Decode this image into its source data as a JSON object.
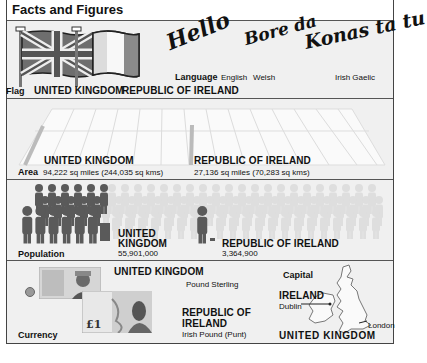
{
  "title": "Facts and Figures",
  "flag": {
    "label": "Flag",
    "uk": "UNITED KINGDOM",
    "ie": "REPUBLIC OF IRELAND"
  },
  "language": {
    "label": "Language",
    "greetings": [
      {
        "word": "Hello",
        "language": "English"
      },
      {
        "word": "Bore da",
        "language": "Welsh"
      },
      {
        "word": "Konas ta tu",
        "language": "Irish Gaelic"
      }
    ]
  },
  "area": {
    "label": "Area",
    "uk": {
      "name": "UNITED KINGDOM",
      "value": "94,222 sq miles (244,035 sq kms)"
    },
    "ie": {
      "name": "REPUBLIC OF IRELAND",
      "value": "27,136 sq miles (70,283 sq kms)"
    }
  },
  "population": {
    "label": "Population",
    "uk": {
      "name_line1": "UNITED",
      "name_line2": "KINGDOM",
      "value": "55,901,000"
    },
    "ie": {
      "name": "REPUBLIC OF IRELAND",
      "value": "3,364,900"
    }
  },
  "currency": {
    "label": "Currency",
    "uk": {
      "name": "UNITED KINGDOM",
      "value": "Pound Sterling",
      "note": "£1"
    },
    "ie": {
      "name_line1": "REPUBLIC OF",
      "name_line2": "IRELAND",
      "value": "Irish Pound (Punt)"
    }
  },
  "capital": {
    "label": "Capital",
    "ie": {
      "name": "IRELAND",
      "city": "Dublin"
    },
    "uk": {
      "name": "UNITED KINGDOM",
      "city": "London"
    }
  },
  "colors": {
    "frame": "#444444",
    "panel": "#f0f0f0",
    "figure_dark": "#5a5a5a",
    "figure_light": "#dcdcdc"
  }
}
